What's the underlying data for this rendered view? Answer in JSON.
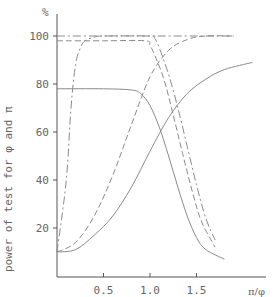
{
  "chart_data": {
    "type": "line",
    "title": "",
    "xlabel": "π/φ",
    "ylabel": "power of test for φ and π",
    "y_unit": "%",
    "xlim": [
      0,
      2.1
    ],
    "ylim": [
      0,
      108
    ],
    "x_ticks": [
      "0.5",
      "1.0",
      "1.5"
    ],
    "y_ticks": [
      "20",
      "40",
      "60",
      "80",
      "100"
    ],
    "grid": false,
    "legend": "none",
    "series": [
      {
        "name": "rising steep (dash-dot)",
        "style": "dashdot",
        "x": [
          0.0,
          0.1,
          0.15,
          0.2,
          0.25,
          0.3,
          0.4,
          0.5,
          1.0,
          1.5,
          1.9
        ],
        "y": [
          10,
          40,
          70,
          88,
          95,
          98,
          99.5,
          100,
          100,
          100,
          100
        ]
      },
      {
        "name": "rising medium (dashed)",
        "style": "dashed",
        "x": [
          0.0,
          0.2,
          0.4,
          0.6,
          0.8,
          1.0,
          1.2,
          1.4,
          1.6,
          1.9
        ],
        "y": [
          10,
          14,
          25,
          42,
          63,
          83,
          94,
          98.5,
          100,
          100
        ]
      },
      {
        "name": "rising slow (solid)",
        "style": "solid",
        "x": [
          0.0,
          0.2,
          0.4,
          0.6,
          0.8,
          1.0,
          1.2,
          1.4,
          1.6,
          1.8,
          2.1
        ],
        "y": [
          10,
          11,
          17,
          25,
          37,
          52,
          66,
          76,
          82,
          86,
          89
        ]
      },
      {
        "name": "falling from 100 (dash-dot)",
        "style": "dashdot",
        "x": [
          0.0,
          0.5,
          1.0,
          1.05,
          1.1,
          1.2,
          1.3,
          1.4,
          1.5,
          1.6,
          1.7
        ],
        "y": [
          100,
          100,
          100,
          99,
          95,
          84,
          70,
          54,
          38,
          24,
          15
        ]
      },
      {
        "name": "falling from 98 (dashed)",
        "style": "dashed",
        "x": [
          0.0,
          0.5,
          0.95,
          1.0,
          1.05,
          1.15,
          1.25,
          1.35,
          1.45,
          1.55,
          1.7
        ],
        "y": [
          98,
          98,
          98,
          96,
          92,
          82,
          67,
          51,
          36,
          23,
          12
        ]
      },
      {
        "name": "falling from 78 (solid)",
        "style": "solid",
        "x": [
          0.0,
          0.5,
          0.8,
          0.9,
          1.0,
          1.1,
          1.2,
          1.3,
          1.4,
          1.5,
          1.6,
          1.8
        ],
        "y": [
          78,
          78,
          77.5,
          76,
          71,
          62,
          50,
          37,
          25,
          16,
          11,
          7
        ]
      }
    ]
  }
}
